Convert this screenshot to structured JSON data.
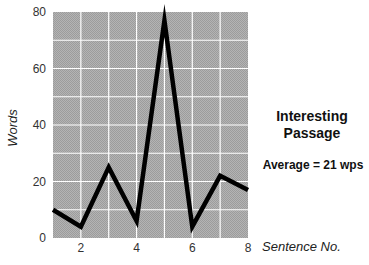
{
  "chart_data": {
    "type": "line",
    "annotation": "Average = 21 wps",
    "xlabel": "Sentence No.",
    "ylabel": "Words",
    "x": [
      1,
      2,
      3,
      4,
      5,
      6,
      7,
      8
    ],
    "series": [
      {
        "name": "Words per sentence",
        "values": [
          10,
          4,
          25,
          6,
          77,
          4,
          22,
          17
        ]
      }
    ],
    "xlim": [
      1,
      8
    ],
    "ylim": [
      0,
      80
    ],
    "x_ticks": [
      2,
      4,
      6,
      8
    ],
    "y_ticks": [
      0,
      20,
      40,
      60,
      80
    ],
    "grid": true,
    "grid_x_step": 1,
    "grid_y_step": 10,
    "legend": "none",
    "colors": {
      "plot_bg": "#a9a9a9",
      "grid": "#ffffff",
      "line": "#000000"
    }
  },
  "side_panel": {
    "title_line1": "Interesting",
    "title_line2": "Passage",
    "average": "Average = 21 wps"
  }
}
